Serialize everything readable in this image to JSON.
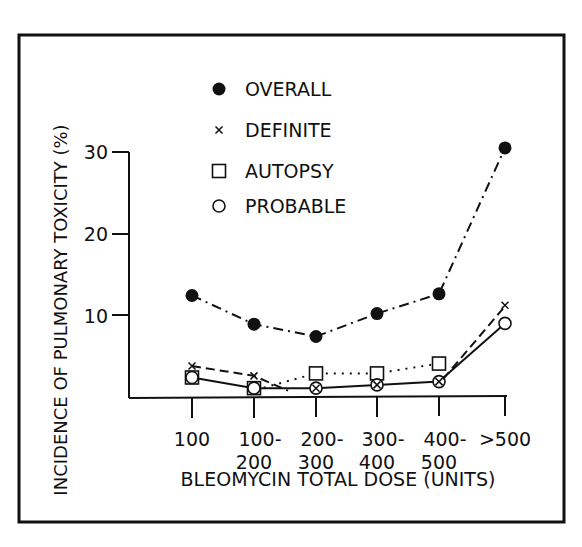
{
  "chart_data": {
    "type": "line",
    "title": "",
    "xlabel": "BLEOMYCIN TOTAL DOSE (UNITS)",
    "ylabel": "INCIDENCE OF PULMONARY TOXICITY (%)",
    "categories": [
      "100",
      "100-200",
      "200-300",
      "300-400",
      "400-500",
      ">500"
    ],
    "category_labels": [
      [
        "100"
      ],
      [
        "100-",
        "200"
      ],
      [
        "200-",
        "300"
      ],
      [
        "300-",
        "400"
      ],
      [
        "400-",
        "500"
      ],
      [
        ">500"
      ]
    ],
    "yticks": [
      10,
      20,
      30
    ],
    "ylim": [
      0,
      32
    ],
    "grid": false,
    "legend_position": "top-center",
    "series": [
      {
        "name": "OVERALL",
        "marker": "filled-circle",
        "line": "dash-dot",
        "values": [
          12.5,
          9.0,
          7.5,
          10.3,
          12.7,
          30.5
        ]
      },
      {
        "name": "DEFINITE",
        "marker": "x",
        "line": "dashed",
        "values": [
          3.9,
          2.7,
          null,
          null,
          null,
          11.3
        ]
      },
      {
        "name": "AUTOPSY",
        "marker": "open-square",
        "line": "dotted",
        "values": [
          2.5,
          1.2,
          3.0,
          3.0,
          4.2,
          null
        ]
      },
      {
        "name": "PROBABLE",
        "marker": "open-circle",
        "line": "solid",
        "values": [
          2.5,
          1.2,
          1.2,
          1.6,
          2.0,
          9.1
        ]
      }
    ]
  }
}
